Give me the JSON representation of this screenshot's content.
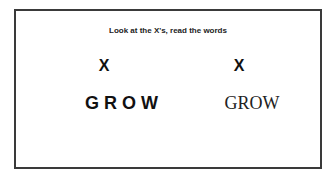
{
  "title": "Look at the X's, read the words",
  "left": {
    "mark": "X",
    "word": "GROW"
  },
  "right": {
    "mark": "X",
    "word": "GROW"
  }
}
